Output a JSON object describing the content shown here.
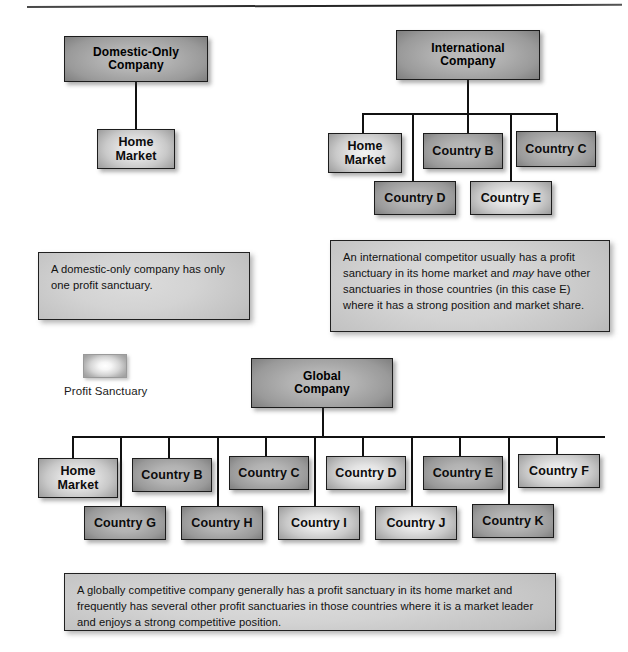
{
  "figure": {
    "kind": "profit-sanctuary-diagram",
    "top_rule": true
  },
  "legend": {
    "swatch_name": "profit-sanctuary-swatch",
    "label": "Profit Sanctuary"
  },
  "domestic": {
    "title": "Domestic-Only\nCompany",
    "title_line1": "Domestic-Only",
    "title_line2": "Company",
    "nodes": [
      {
        "label": "Home\nMarket",
        "line1": "Home",
        "line2": "Market",
        "sanctuary": true
      }
    ],
    "note": "A domestic-only company has only one profit sanctuary."
  },
  "international": {
    "title_line1": "International",
    "title_line2": "Company",
    "row1": [
      {
        "line1": "Home",
        "line2": "Market",
        "sanctuary": true
      },
      {
        "line1": "Country B",
        "line2": "",
        "sanctuary": false
      },
      {
        "line1": "Country C",
        "line2": "",
        "sanctuary": false
      }
    ],
    "row2": [
      {
        "line1": "Country D",
        "line2": "",
        "sanctuary": false
      },
      {
        "line1": "Country E",
        "line2": "",
        "sanctuary": true
      }
    ],
    "note_part1": "An international competitor usually has a profit sanctuary in its home market and ",
    "note_italic": "may",
    "note_part2": " have other sanctuaries in those countries (in this case E) where it has a strong position and market share."
  },
  "global": {
    "title_line1": "Global",
    "title_line2": "Company",
    "row1": [
      {
        "line1": "Home",
        "line2": "Market",
        "sanctuary": true
      },
      {
        "line1": "Country B",
        "line2": "",
        "sanctuary": false
      },
      {
        "line1": "Country C",
        "line2": "",
        "sanctuary": false
      },
      {
        "line1": "Country D",
        "line2": "",
        "sanctuary": true
      },
      {
        "line1": "Country E",
        "line2": "",
        "sanctuary": false
      },
      {
        "line1": "Country F",
        "line2": "",
        "sanctuary": true
      }
    ],
    "row2": [
      {
        "line1": "Country G",
        "line2": "",
        "sanctuary": false
      },
      {
        "line1": "Country H",
        "line2": "",
        "sanctuary": false
      },
      {
        "line1": "Country I",
        "line2": "",
        "sanctuary": true
      },
      {
        "line1": "Country J",
        "line2": "",
        "sanctuary": true
      },
      {
        "line1": "Country K",
        "line2": "",
        "sanctuary": false
      }
    ],
    "note": "A globally competitive company generally has a profit sanctuary in its home market and frequently has several other profit sanctuaries in those countries where it is a market leader and enjoys a strong competitive position."
  },
  "colors": {
    "line": "#111111",
    "box_border": "#1c1c1c",
    "note_fill": "#d3d3d3",
    "page_bg": "#ffffff"
  }
}
